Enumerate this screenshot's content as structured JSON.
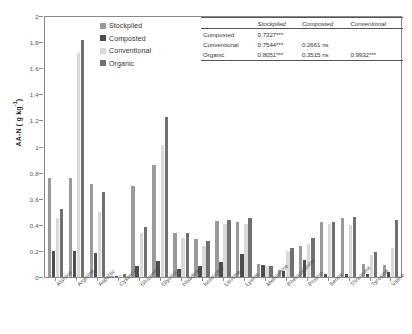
{
  "chart_data": {
    "type": "bar",
    "title": "",
    "xlabel": "",
    "ylabel": "AA-N ( g kg-1)",
    "ylim": [
      0,
      2
    ],
    "ytick_labels": [
      "0",
      "0.2",
      "0.4",
      "0.6",
      "0.8",
      "1",
      "1.2",
      "1.4",
      "1.6",
      "1.8",
      "2"
    ],
    "ytick_values": [
      0,
      0.2,
      0.4,
      0.6,
      0.8,
      1.0,
      1.2,
      1.4,
      1.6,
      1.8,
      2.0
    ],
    "grid": false,
    "legend_position": "top-center",
    "categories": [
      "Alanine",
      "Arginine",
      "Aspartic",
      "Cysteine",
      "Glutamic",
      "Glycine",
      "Histidine",
      "Isoleucine",
      "Leucine",
      "Lysine",
      "Methionine",
      "Phenylalanine",
      "Proline",
      "Serine",
      "Threonine",
      "Tyrosine",
      "Valine"
    ],
    "series": [
      {
        "name": "Stockpiled",
        "color": "#9a9a9a",
        "values": [
          0.76,
          0.76,
          0.71,
          0.01,
          0.7,
          0.86,
          0.34,
          0.29,
          0.43,
          0.42,
          0.1,
          0.05,
          0.24,
          0.42,
          0.45,
          0.1,
          0.09
        ]
      },
      {
        "name": "Composted",
        "color": "#4d4d4d",
        "values": [
          0.2,
          0.2,
          0.185,
          0.005,
          0.085,
          0.125,
          0.065,
          0.085,
          0.115,
          0.175,
          0.095,
          0.045,
          0.13,
          0.02,
          0.025,
          0.02,
          0.035
        ]
      },
      {
        "name": "Conventional",
        "color": "#d9d9d9",
        "values": [
          0.45,
          1.72,
          0.5,
          0.015,
          0.34,
          1.01,
          0.3,
          0.235,
          0.41,
          0.405,
          0.085,
          0.2,
          0.255,
          0.41,
          0.4,
          0.165,
          0.22
        ]
      },
      {
        "name": "Organic",
        "color": "#707070",
        "values": [
          0.52,
          1.82,
          0.655,
          0.02,
          0.385,
          1.23,
          0.335,
          0.275,
          0.44,
          0.455,
          0.085,
          0.225,
          0.3,
          0.425,
          0.46,
          0.195,
          0.44
        ]
      }
    ]
  },
  "legend": {
    "items": [
      {
        "label": "Stockpiled",
        "color": "#9a9a9a"
      },
      {
        "label": "Composted",
        "color": "#4d4d4d"
      },
      {
        "label": "Conventional",
        "color": "#d9d9d9"
      },
      {
        "label": "Organic",
        "color": "#707070"
      }
    ]
  },
  "corr_table": {
    "headers": [
      "",
      "Stockpiled",
      "Composted",
      "Conventional"
    ],
    "rows": [
      {
        "label": "Composted",
        "cells": [
          "0.7327***",
          "",
          ""
        ]
      },
      {
        "label": "Conventional",
        "cells": [
          "0.7544***",
          "0.2661 ns",
          ""
        ]
      },
      {
        "label": "Organic",
        "cells": [
          "0.8051***",
          "0.3515 ns",
          "0.9932***"
        ]
      }
    ]
  }
}
